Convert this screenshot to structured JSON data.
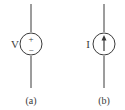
{
  "diagram": {
    "type": "circuit-symbols",
    "panels": [
      {
        "id": "a",
        "caption": "(a)",
        "symbol": "independent-voltage-source",
        "variable_label": "V",
        "polarity_top": "+",
        "polarity_bottom": "−"
      },
      {
        "id": "b",
        "caption": "(b)",
        "symbol": "independent-current-source",
        "variable_label": "I",
        "arrow_direction": "up"
      }
    ],
    "colors": {
      "stroke": "#3a3a3a",
      "background": "#ffffff"
    }
  }
}
